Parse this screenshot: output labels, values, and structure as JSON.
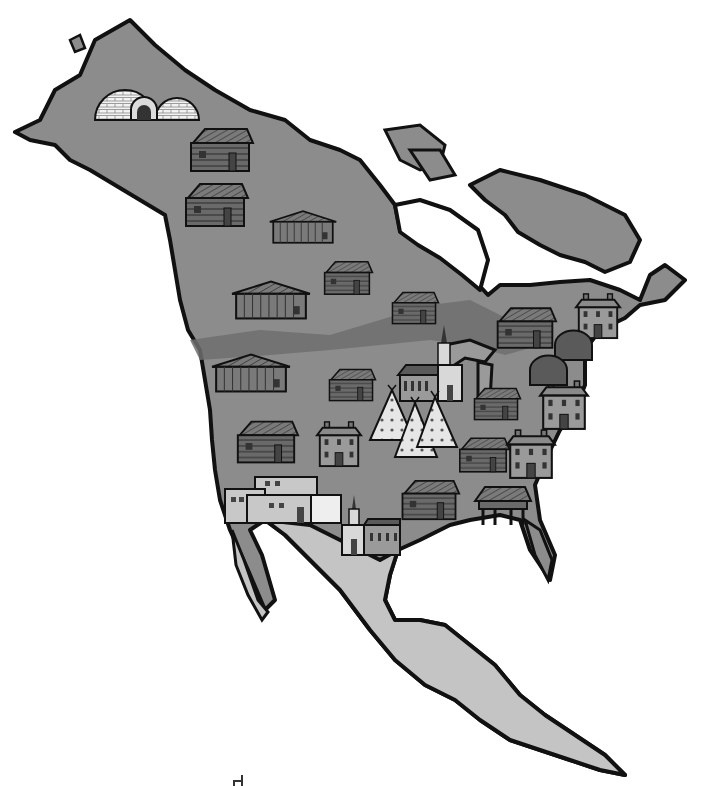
{
  "map": {
    "title": "North America",
    "colors": {
      "ocean": "#ffffff",
      "land_outline": "#111111",
      "region_north": "#8c8c8c",
      "region_mid": "#9a9a9a",
      "region_band": "#6e6e6e",
      "region_south": "#c4c4c4",
      "lake": "#ffffff"
    },
    "dwellings": [
      {
        "type": "igloo",
        "label": "Igloos",
        "x": 95,
        "y": 80
      },
      {
        "type": "log-cabin",
        "label": "Log cabin",
        "x": 185,
        "y": 125
      },
      {
        "type": "log-cabin",
        "label": "Log cabin",
        "x": 180,
        "y": 180
      },
      {
        "type": "plank-house",
        "label": "Plank house",
        "x": 268,
        "y": 208
      },
      {
        "type": "log-cabin",
        "label": "Log cabin",
        "x": 320,
        "y": 255
      },
      {
        "type": "plank-house",
        "label": "Plank house",
        "x": 230,
        "y": 278
      },
      {
        "type": "log-cabin",
        "label": "Log cabin",
        "x": 388,
        "y": 285
      },
      {
        "type": "log-cabin",
        "label": "Log cabin",
        "x": 492,
        "y": 298
      },
      {
        "type": "colonial-house",
        "label": "Colonial house",
        "x": 572,
        "y": 292
      },
      {
        "type": "longhouse",
        "label": "Longhouse",
        "x": 555,
        "y": 335
      },
      {
        "type": "longhouse",
        "label": "Longhouse",
        "x": 530,
        "y": 360
      },
      {
        "type": "plank-house",
        "label": "Plank house",
        "x": 210,
        "y": 350
      },
      {
        "type": "log-cabin",
        "label": "Log cabin",
        "x": 325,
        "y": 362
      },
      {
        "type": "church",
        "label": "Church",
        "x": 398,
        "y": 325
      },
      {
        "type": "log-cabin",
        "label": "Log cabin",
        "x": 470,
        "y": 380
      },
      {
        "type": "colonial-house",
        "label": "Colonial house",
        "x": 538,
        "y": 378
      },
      {
        "type": "teepee",
        "label": "Teepees",
        "x": 367,
        "y": 385
      },
      {
        "type": "log-cabin",
        "label": "Log cabin",
        "x": 232,
        "y": 410
      },
      {
        "type": "colonial-house",
        "label": "Colonial house",
        "x": 315,
        "y": 418
      },
      {
        "type": "log-cabin",
        "label": "Log cabin",
        "x": 455,
        "y": 430
      },
      {
        "type": "colonial-house",
        "label": "Colonial house",
        "x": 505,
        "y": 428
      },
      {
        "type": "adobe-pueblo",
        "label": "Adobe pueblo",
        "x": 225,
        "y": 475
      },
      {
        "type": "log-cabin",
        "label": "Log cabin",
        "x": 397,
        "y": 470
      },
      {
        "type": "stilt-house",
        "label": "Stilt house",
        "x": 475,
        "y": 485
      },
      {
        "type": "mission-church",
        "label": "Mission church",
        "x": 340,
        "y": 495
      }
    ]
  }
}
